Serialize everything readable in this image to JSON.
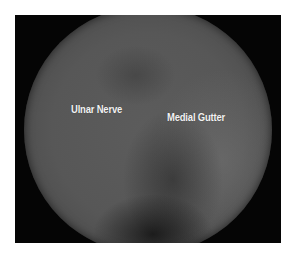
{
  "image": {
    "type": "arthroscopic-view",
    "frame_color": "#050505",
    "background_color": "#ffffff",
    "labels": [
      {
        "text": "Ulnar Nerve"
      },
      {
        "text": "Medial Gutter"
      }
    ]
  }
}
